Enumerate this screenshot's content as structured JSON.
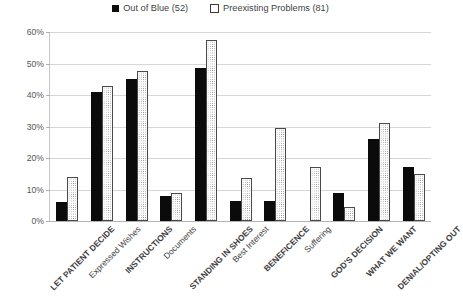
{
  "chart_data": {
    "type": "bar",
    "title": "",
    "subtitle": "",
    "xlabel": "",
    "ylabel": "",
    "ylim": [
      0,
      60
    ],
    "ytick_labels": [
      "0%",
      "10%",
      "20%",
      "30%",
      "40%",
      "50%",
      "60%"
    ],
    "ytick_values": [
      0,
      10,
      20,
      30,
      40,
      50,
      60
    ],
    "grid": true,
    "legend_position": "top-center",
    "categories": [
      "LET PATIENT DECIDE",
      "Expressed Wishes",
      "INSTRUCTIONS",
      "Documents",
      "STANDING IN SHOES",
      "Best Interest",
      "BENEFICENCE",
      "Suffering",
      "GOD'S DECISION",
      "WHAT WE WANT",
      "DENIAL/OPTING OUT"
    ],
    "category_styles": [
      "caps",
      "normal",
      "caps",
      "normal",
      "caps",
      "normal",
      "caps",
      "normal",
      "caps",
      "caps",
      "caps"
    ],
    "series": [
      {
        "name": "Out of Blue (52)",
        "pattern": "solid-black",
        "color": "#0b0b0b",
        "values": [
          6,
          41,
          45,
          8,
          48.5,
          6.5,
          6.5,
          null,
          9,
          26,
          17
        ]
      },
      {
        "name": "Preexisting Problems (81)",
        "pattern": "dotted-light",
        "color": "#fdfdfd",
        "values": [
          14,
          43,
          47.5,
          9,
          57.5,
          13.5,
          29.5,
          17,
          4.5,
          31,
          15
        ]
      }
    ]
  },
  "legend": {
    "entries": [
      {
        "label": "Out of Blue (52)",
        "swatch": "solid"
      },
      {
        "label": "Preexisting Problems (81)",
        "swatch": "dotted"
      }
    ]
  }
}
